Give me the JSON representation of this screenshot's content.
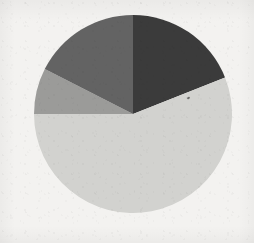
{
  "figure": {
    "kind": "pie-chart-scan",
    "title": "",
    "background_color": "#f3f2f0",
    "center_x": 133,
    "center_y": 114,
    "radius": 99,
    "artifact_speck_label": "scan-speck"
  },
  "chart_data": {
    "type": "pie",
    "title": "",
    "xlabel": "",
    "ylabel": "",
    "legend": "none",
    "grid": false,
    "start_angle_deg": 0,
    "direction": "clockwise",
    "labels": [
      "Segment 1",
      "Segment 2",
      "Segment 3",
      "Segment 4"
    ],
    "values": [
      19,
      56,
      7.5,
      17.5
    ],
    "angles_deg": [
      68.4,
      201.6,
      27,
      63
    ],
    "colors": [
      "#3a3a3a",
      "#d2d2cf",
      "#9b9b99",
      "#646464"
    ],
    "slices": [
      {
        "label": "Segment 1",
        "value": 19,
        "angle_deg": 68.4,
        "start_deg": 0,
        "end_deg": 68.4,
        "color": "#3a3a3a",
        "shade": "charcoal"
      },
      {
        "label": "Segment 2",
        "value": 56,
        "angle_deg": 201.6,
        "start_deg": 68.4,
        "end_deg": 270,
        "color": "#d2d2cf",
        "shade": "light-gray"
      },
      {
        "label": "Segment 3",
        "value": 7.5,
        "angle_deg": 27,
        "start_deg": 270,
        "end_deg": 297,
        "color": "#9b9b99",
        "shade": "medium-gray"
      },
      {
        "label": "Segment 4",
        "value": 17.5,
        "angle_deg": 63,
        "start_deg": 297,
        "end_deg": 360,
        "color": "#646464",
        "shade": "dark-gray"
      }
    ]
  }
}
